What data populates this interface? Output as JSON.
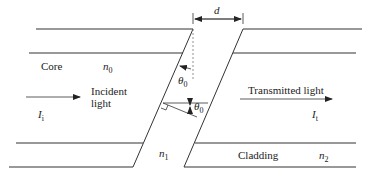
{
  "diagram": {
    "labels": {
      "core": "Core",
      "cladding": "Cladding",
      "incident_line1": "Incident",
      "incident_line2": "light",
      "transmitted": "Transmitted light",
      "gap": "d",
      "theta_symbol": "θ",
      "theta_sub": "0",
      "n0_symbol": "n",
      "n0_sub": "0",
      "n1_symbol": "n",
      "n1_sub": "1",
      "n2_symbol": "n",
      "n2_sub": "2",
      "Ii_symbol": "I",
      "Ii_sub": "i",
      "It_symbol": "I",
      "It_sub": "t"
    },
    "colors": {
      "line": "#333333",
      "dashed": "#777777",
      "text": "#222222"
    }
  }
}
